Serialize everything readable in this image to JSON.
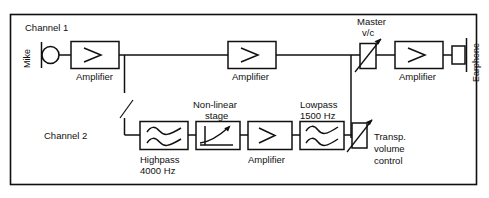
{
  "figure": {
    "border": "rectangular outline frame",
    "line_color": "#101010",
    "background_color": "#ffffff"
  },
  "channels": {
    "channel1": {
      "label": "Channel 1",
      "input": {
        "name": "Mike",
        "label": "Mike",
        "symbol": "microphone-circle-with-bar",
        "orientation": "vertical-text"
      },
      "stages": [
        {
          "id": "amp1",
          "label": "Amplifier",
          "symbol": "amplifier-triangle"
        },
        {
          "id": "amp2",
          "label": "Amplifier",
          "symbol": "amplifier-triangle"
        }
      ]
    },
    "channel2": {
      "label": "Channel 2",
      "stages": [
        {
          "id": "highpass",
          "label_line1": "Highpass",
          "label_line2": "4000 Hz",
          "symbol": "double-wave-filter",
          "label_position": "below"
        },
        {
          "id": "nonlinear",
          "label_line1": "Non-linear",
          "label_line2": "stage",
          "symbol": "nonlinear-transfer-curve",
          "label_position": "above"
        },
        {
          "id": "amp3",
          "label_line1": "Amplifier",
          "symbol": "amplifier-triangle",
          "label_position": "below"
        },
        {
          "id": "lowpass",
          "label_line1": "Lowpass",
          "label_line2": "1500 Hz",
          "symbol": "double-wave-filter",
          "label_position": "above"
        },
        {
          "id": "transp-volume-control",
          "label_line1": "Transp.",
          "label_line2": "volume",
          "label_line3": "control",
          "symbol": "variable-attenuator-with-arrow",
          "label_position": "right"
        }
      ]
    }
  },
  "output_chain": {
    "master_control": {
      "label_line1": "Master",
      "label_line2": "v/c",
      "symbol": "variable-attenuator-with-arrow"
    },
    "output_amplifier": {
      "label": "Amplifier",
      "symbol": "amplifier-triangle"
    },
    "output_transducer": {
      "label": "Earphone",
      "symbol": "earphone-rectangle-with-bar",
      "orientation": "vertical-text"
    }
  }
}
